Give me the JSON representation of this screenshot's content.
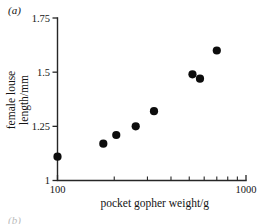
{
  "figure": {
    "panel_label": "(a)",
    "next_panel_label": "(b)"
  },
  "chart_data": {
    "type": "scatter",
    "title": "",
    "xlabel": "pocket gopher weight/g",
    "ylabel": "female louse length/mm",
    "xscale": "log",
    "yscale": "linear",
    "xlim": [
      100,
      1000
    ],
    "ylim": [
      1,
      1.75
    ],
    "grid": false,
    "legend": false,
    "legend_position": "none",
    "x_tick_labels": [
      "100",
      "1000"
    ],
    "x_tick_values": [
      100,
      1000
    ],
    "x_minor_tick_values": [
      200,
      300,
      400,
      500,
      600,
      700,
      800,
      900
    ],
    "y_tick_labels": [
      "1",
      "1.25",
      "1.5",
      "1.75"
    ],
    "y_tick_values": [
      1,
      1.25,
      1.5,
      1.75
    ],
    "marker": "filled-circle",
    "marker_color": "#0d0d0d",
    "x": [
      100,
      175,
      205,
      260,
      325,
      520,
      570,
      700
    ],
    "y": [
      1.11,
      1.17,
      1.21,
      1.25,
      1.32,
      1.49,
      1.47,
      1.6
    ],
    "points": [
      {
        "x": 100,
        "y": 1.11
      },
      {
        "x": 175,
        "y": 1.17
      },
      {
        "x": 205,
        "y": 1.21
      },
      {
        "x": 260,
        "y": 1.25
      },
      {
        "x": 325,
        "y": 1.32
      },
      {
        "x": 520,
        "y": 1.49
      },
      {
        "x": 570,
        "y": 1.47
      },
      {
        "x": 700,
        "y": 1.6
      }
    ]
  }
}
